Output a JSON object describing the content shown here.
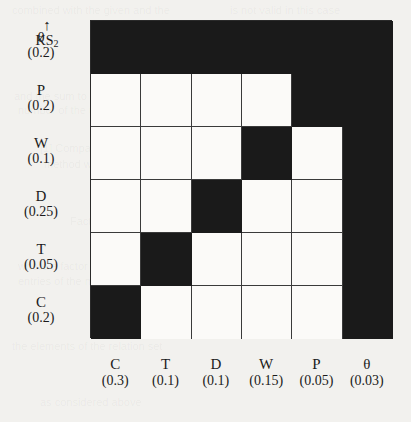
{
  "caption": {
    "arrow": "↑",
    "label": "KS",
    "label_sub": "2"
  },
  "matrix": {
    "row_axis_symbols": [
      "θ",
      "P",
      "W",
      "D",
      "T",
      "C"
    ],
    "row_values": [
      "(0.2)",
      "(0.2)",
      "(0.1)",
      "(0.25)",
      "(0.05)",
      "(0.2)"
    ],
    "col_axis_symbols": [
      "C",
      "T",
      "D",
      "W",
      "P",
      "θ"
    ],
    "col_values": [
      "(0.3)",
      "(0.1)",
      "(0.1)",
      "(0.15)",
      "(0.05)",
      "(0.03)"
    ],
    "fill_color": "#1a1a1a",
    "empty_color": "#fbfaf8",
    "line_color": "#3a3a3a",
    "cells": [
      [
        1,
        1,
        1,
        1,
        1,
        1
      ],
      [
        0,
        0,
        0,
        0,
        1,
        1
      ],
      [
        0,
        0,
        0,
        1,
        0,
        1
      ],
      [
        0,
        0,
        1,
        0,
        0,
        1
      ],
      [
        0,
        1,
        0,
        0,
        0,
        1
      ],
      [
        1,
        0,
        0,
        0,
        0,
        1
      ]
    ]
  },
  "chart_data": {
    "type": "heatmap",
    "title": "",
    "xlabel": "",
    "ylabel": "KS2",
    "rows": [
      "θ (0.2)",
      "P (0.2)",
      "W (0.1)",
      "D (0.25)",
      "T (0.05)",
      "C (0.2)"
    ],
    "columns": [
      "C (0.3)",
      "T (0.1)",
      "D (0.1)",
      "W (0.15)",
      "P (0.05)",
      "θ (0.03)"
    ],
    "values": [
      [
        1,
        1,
        1,
        1,
        1,
        1
      ],
      [
        0,
        0,
        0,
        0,
        1,
        1
      ],
      [
        0,
        0,
        0,
        1,
        0,
        1
      ],
      [
        0,
        0,
        1,
        0,
        0,
        1
      ],
      [
        0,
        1,
        0,
        0,
        0,
        1
      ],
      [
        1,
        0,
        0,
        0,
        0,
        1
      ]
    ],
    "legend": [],
    "grid": true
  },
  "ghost_text": [
    {
      "x": 12,
      "y": 4,
      "t": "combined with the given and the"
    },
    {
      "x": 230,
      "y": 4,
      "t": "is not valid in this case"
    },
    {
      "x": 14,
      "y": 90,
      "t": "and the sum to the left of the table"
    },
    {
      "x": 18,
      "y": 104,
      "t": "number of the units"
    },
    {
      "x": 40,
      "y": 142,
      "t": "[1] Comparison analysis of the"
    },
    {
      "x": 44,
      "y": 158,
      "t": "method with the structure"
    },
    {
      "x": 70,
      "y": 215,
      "t": "Factor Structuring"
    },
    {
      "x": 18,
      "y": 260,
      "t": "where a factor is given as"
    },
    {
      "x": 18,
      "y": 275,
      "t": "entries of the matrix"
    },
    {
      "x": 12,
      "y": 340,
      "t": "the elements of the relation set"
    },
    {
      "x": 40,
      "y": 396,
      "t": "as considered above"
    }
  ]
}
